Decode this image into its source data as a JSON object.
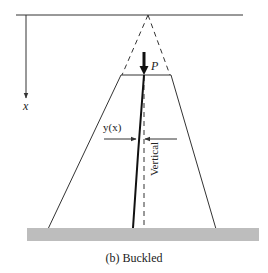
{
  "figure": {
    "caption": "(b) Buckled",
    "labels": {
      "axis_x": "x",
      "load": "P",
      "deflection": "y(x)",
      "reference_line": "Vertical"
    },
    "colors": {
      "lines": "#333333",
      "ground": "#bdbdbd",
      "column": "#111111"
    }
  }
}
